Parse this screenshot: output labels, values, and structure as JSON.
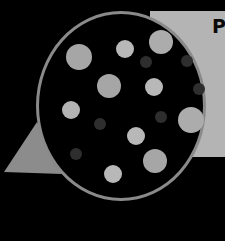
{
  "panel": {
    "letter": "P",
    "color": "#b4b4b4"
  },
  "lens": {
    "ring_color": "#8a8a8a",
    "fill": "#000000"
  },
  "triangle": {
    "color": "#8c8c8c"
  },
  "dots": [
    {
      "cx": 79,
      "cy": 57,
      "r": 13,
      "color": "#a6a6a6"
    },
    {
      "cx": 125,
      "cy": 49,
      "r": 9,
      "color": "#b8b8b8"
    },
    {
      "cx": 161,
      "cy": 42,
      "r": 12,
      "color": "#acacac"
    },
    {
      "cx": 146,
      "cy": 62,
      "r": 6,
      "color": "#2e2e2e"
    },
    {
      "cx": 187,
      "cy": 61,
      "r": 6,
      "color": "#2e2e2e"
    },
    {
      "cx": 109,
      "cy": 86,
      "r": 12,
      "color": "#a6a6a6"
    },
    {
      "cx": 154,
      "cy": 87,
      "r": 9,
      "color": "#b8b8b8"
    },
    {
      "cx": 199,
      "cy": 89,
      "r": 6,
      "color": "#2e2e2e"
    },
    {
      "cx": 71,
      "cy": 110,
      "r": 9,
      "color": "#b4b4b4"
    },
    {
      "cx": 100,
      "cy": 124,
      "r": 6,
      "color": "#2e2e2e"
    },
    {
      "cx": 161,
      "cy": 117,
      "r": 6,
      "color": "#2e2e2e"
    },
    {
      "cx": 191,
      "cy": 120,
      "r": 13,
      "color": "#acacac"
    },
    {
      "cx": 136,
      "cy": 136,
      "r": 9,
      "color": "#b8b8b8"
    },
    {
      "cx": 76,
      "cy": 154,
      "r": 6,
      "color": "#2e2e2e"
    },
    {
      "cx": 155,
      "cy": 161,
      "r": 12,
      "color": "#a6a6a6"
    },
    {
      "cx": 113,
      "cy": 174,
      "r": 9,
      "color": "#b8b8b8"
    }
  ]
}
